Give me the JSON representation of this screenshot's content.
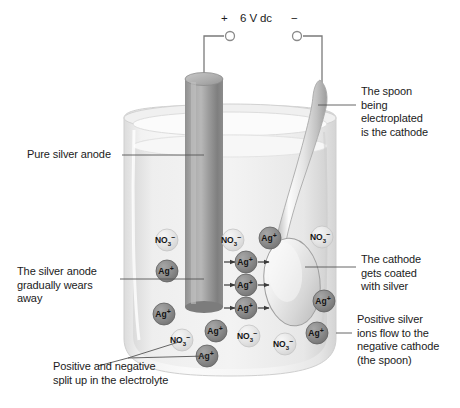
{
  "power_supply": {
    "positive_sign": "+",
    "label": "6 V dc",
    "negative_sign": "−"
  },
  "labels": {
    "anode": "Pure silver anode",
    "anode_wears": "The silver anode\ngradually wears\naway",
    "split_up": "Positive and negative\nsplit up in the electrolyte",
    "spoon_cathode": "The spoon\nbeing\nelectroplated\nis the cathode",
    "cathode_coated": "The cathode\ngets coated\nwith silver",
    "ions_flow": "Positive silver\nions flow to the\nnegative cathode\n(the spoon)"
  },
  "ions": {
    "silver": {
      "symbol": "Ag",
      "charge": "+",
      "fill": "#8a8a8a"
    },
    "nitrate": {
      "symbol": "NO",
      "subscript": "3",
      "charge": "−",
      "fill": "#e2e2e2"
    },
    "items": [
      {
        "kind": "nitrate",
        "x": 167,
        "y": 240
      },
      {
        "kind": "silver",
        "x": 167,
        "y": 271
      },
      {
        "kind": "nitrate",
        "x": 233,
        "y": 240
      },
      {
        "kind": "silver",
        "x": 270,
        "y": 238
      },
      {
        "kind": "nitrate",
        "x": 322,
        "y": 237
      },
      {
        "kind": "silver",
        "x": 246,
        "y": 262
      },
      {
        "kind": "silver",
        "x": 246,
        "y": 285
      },
      {
        "kind": "silver",
        "x": 246,
        "y": 308
      },
      {
        "kind": "silver",
        "x": 324,
        "y": 301
      },
      {
        "kind": "silver",
        "x": 164,
        "y": 314
      },
      {
        "kind": "nitrate",
        "x": 182,
        "y": 340
      },
      {
        "kind": "silver",
        "x": 216,
        "y": 331
      },
      {
        "kind": "nitrate",
        "x": 249,
        "y": 336
      },
      {
        "kind": "silver",
        "x": 207,
        "y": 356
      },
      {
        "kind": "nitrate",
        "x": 285,
        "y": 344
      },
      {
        "kind": "silver",
        "x": 317,
        "y": 333
      }
    ]
  },
  "colors": {
    "silver_ion": "#8a8a8a",
    "nitrate_ion": "#e2e2e2",
    "anode_rod": "#9b9b9b",
    "beaker_glass": "#e9e9e9",
    "wire": "#7a7a7a",
    "leader_line": "#555555",
    "text": "#1b1b1b"
  }
}
